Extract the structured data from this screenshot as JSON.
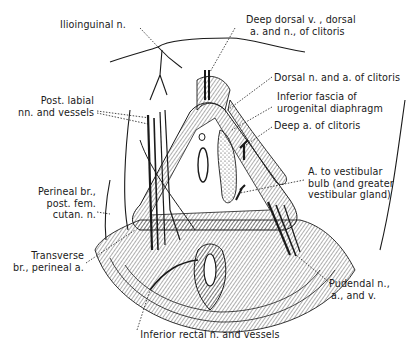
{
  "figure": {
    "colors": {
      "ink": "#1a1a1a",
      "background": "#ffffff",
      "shade": "#bdbdbd"
    },
    "labels": {
      "ilioinguinal": [
        "Ilioinguinal n."
      ],
      "deep_dorsal": [
        "Deep dorsal v. , dorsal",
        "a. and n., of clitoris"
      ],
      "dorsal_n_a": [
        "Dorsal n. and a. of clitoris"
      ],
      "inferior_fascia": [
        "Inferior fascia of",
        "urogenital diaphragm"
      ],
      "deep_a": [
        "Deep a. of clitoris"
      ],
      "post_labial": [
        "Post. labial",
        "nn. and vessels"
      ],
      "a_vestibular": [
        "A. to vestibular",
        "bulb (and greater",
        "vestibular gland)"
      ],
      "perineal_br": [
        "Perineal br.,",
        "post. fem.",
        "cutan. n."
      ],
      "transverse_br": [
        "Transverse",
        "br., perineal a."
      ],
      "pudendal": [
        "Pudendal n.,",
        "a., and v."
      ],
      "inferior_rectal": [
        "Inferior rectal n. and vessels"
      ]
    }
  }
}
